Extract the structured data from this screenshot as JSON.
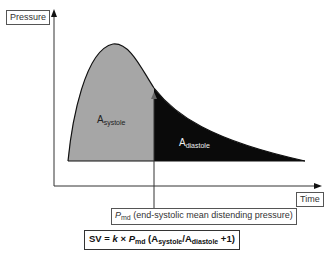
{
  "diagram": {
    "y_axis_label": "Pressure",
    "x_axis_label": "Time",
    "areas": {
      "systole": {
        "base": "A",
        "sub": "systole",
        "color": "#a6a6a6"
      },
      "diastole": {
        "base": "A",
        "sub": "diastole",
        "color": "#0a0a0a"
      }
    },
    "pointer": {
      "symbol": "P",
      "sub": "md",
      "description": "(end-systolic mean distending pressure)"
    },
    "formula": {
      "lhs": "SV = ",
      "k": "k",
      "times": " × ",
      "p": "P",
      "p_sub": "md",
      "open": " (A",
      "a1_sub": "systole",
      "slash": "/A",
      "a2_sub": "diastole",
      "close": " +1)"
    }
  }
}
